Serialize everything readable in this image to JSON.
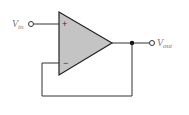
{
  "diagram": {
    "input_label": {
      "main": "V",
      "sub": "in"
    },
    "output_label": {
      "main": "V",
      "sub": "out"
    },
    "plus_sign": "+",
    "minus_sign": "−",
    "colors": {
      "opamp_fill": "#c4c4c4",
      "wire": "#333333",
      "label": "#777777"
    }
  }
}
